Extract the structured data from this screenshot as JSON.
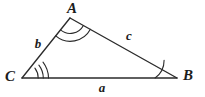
{
  "figure": {
    "name": "labeled-triangle",
    "background_color": "#ffffff",
    "stroke_color": "#2b2b2b",
    "width": 205,
    "height": 97
  },
  "vertices": [
    {
      "id": "A",
      "label": "A",
      "x": 70,
      "y": 18,
      "label_x": 72,
      "label_y": 13,
      "angle_arcs": 2
    },
    {
      "id": "B",
      "label": "B",
      "x": 177,
      "y": 78,
      "label_x": 188,
      "label_y": 80,
      "angle_arcs": 1
    },
    {
      "id": "C",
      "label": "C",
      "x": 22,
      "y": 78,
      "label_x": 10,
      "label_y": 81,
      "angle_arcs": 3
    }
  ],
  "sides": [
    {
      "id": "a",
      "label": "a",
      "from": "C",
      "to": "B",
      "label_x": 102,
      "label_y": 92
    },
    {
      "id": "b",
      "label": "b",
      "from": "C",
      "to": "A",
      "label_x": 38,
      "label_y": 48
    },
    {
      "id": "c",
      "label": "c",
      "from": "A",
      "to": "B",
      "label_x": 129,
      "label_y": 40
    }
  ],
  "edge_paths": {
    "ca": "M 22 78 L 70 18",
    "ab": "M 70 18 L 177 78",
    "cb": "M 22 78 L 177 78"
  },
  "angle_arc_paths": {
    "A": [
      "M 60.5 29.9 A 15 15 0 0 0 83.4 25.5",
      "M 55.7 35.9 A 22.7 22.7 0 0 0 90.4 29.3"
    ],
    "B": [
      "M 155.1 78 A 21.9 21.9 0 0 0 164.1 60.2"
    ],
    "C": [
      "M 38.2 78 A 16.2 16.2 0 0 0 34.9 68.2",
      "M 43.3 78 A 21.3 21.3 0 0 0 38.9 65.1",
      "M 48.5 78 A 26.5 26.5 0 0 0 43 62.1"
    ]
  }
}
